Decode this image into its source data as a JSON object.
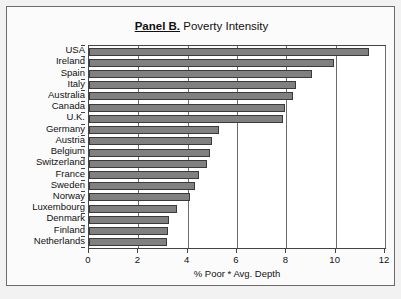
{
  "figure": {
    "title_panel": "Panel B.",
    "title_text": "Poverty Intensity",
    "background_color": "#f2f2f2",
    "plot_background_color": "#ffffff",
    "bar_color": "#808080",
    "bar_edge_color": "#3a3a3a",
    "axis_color": "#444444",
    "grid_color": "#6d6d6d"
  },
  "chart_data": {
    "type": "bar",
    "orientation": "horizontal",
    "title": "Panel B. Poverty Intensity",
    "xlabel": "% Poor * Avg. Depth",
    "ylabel": "",
    "xlim": [
      0,
      12
    ],
    "xticks": [
      0,
      2,
      4,
      6,
      8,
      10,
      12
    ],
    "xticklabels": [
      "0",
      "2",
      "4",
      "6",
      "8",
      "10",
      "12"
    ],
    "grid": true,
    "legend": false,
    "categories": [
      "USA",
      "Ireland",
      "Spain",
      "Italy",
      "Australia",
      "Canada",
      "U.K.",
      "Germany",
      "Austria",
      "Belgium",
      "Switzerland",
      "France",
      "Sweden",
      "Norway",
      "Luxembourg",
      "Denmark",
      "Finland",
      "Netherlands"
    ],
    "values": [
      11.35,
      9.95,
      9.05,
      8.4,
      8.25,
      7.95,
      7.85,
      5.25,
      5.0,
      4.9,
      4.8,
      4.45,
      4.3,
      4.1,
      3.55,
      3.25,
      3.2,
      3.15
    ]
  }
}
